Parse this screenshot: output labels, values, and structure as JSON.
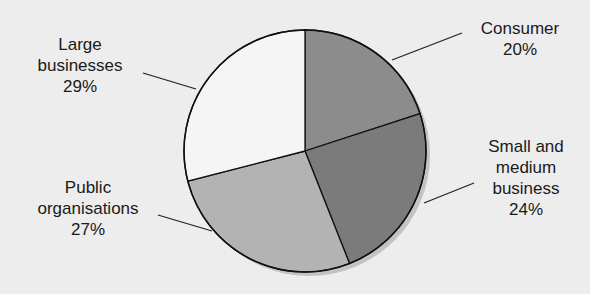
{
  "chart_data": {
    "type": "pie",
    "title": "",
    "start_angle_deg": 0,
    "direction": "clockwise",
    "slices": [
      {
        "label": "Consumer",
        "value": 20,
        "display": "20%",
        "color": "#8c8c8c"
      },
      {
        "label": "Small and medium business",
        "value": 24,
        "display": "24%",
        "color": "#7b7b7b"
      },
      {
        "label": "Public organisations",
        "value": 27,
        "display": "27%",
        "color": "#b3b3b3"
      },
      {
        "label": "Large businesses",
        "value": 29,
        "display": "29%",
        "color": "#f5f5f5"
      }
    ]
  },
  "labels": {
    "consumer": {
      "line1": "Consumer",
      "pct": "20%"
    },
    "small": {
      "line1": "Small and",
      "line2": "medium",
      "line3": "business",
      "pct": "24%"
    },
    "public": {
      "line1": "Public",
      "line2": "organisations",
      "pct": "27%"
    },
    "large": {
      "line1": "Large",
      "line2": "businesses",
      "pct": "29%"
    }
  }
}
